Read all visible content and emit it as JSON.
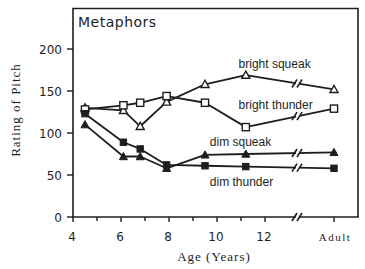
{
  "chart_data": {
    "type": "line",
    "title": "Metaphors",
    "xlabel": "Age (Years)",
    "ylabel": "Rating of Pitch",
    "ylim": [
      0,
      200
    ],
    "yticks": [
      0,
      50,
      100,
      150,
      200
    ],
    "xticks_major": [
      4,
      6,
      8,
      10,
      12
    ],
    "xticks_minor": [
      5,
      7,
      9,
      11
    ],
    "xtick_labels": [
      "4",
      "6",
      "8",
      "10",
      "12",
      "Adult"
    ],
    "x_axis_break": "between 12 and Adult",
    "grid": false,
    "legend": "inline labels",
    "x": [
      4.5,
      6.1,
      6.8,
      7.9,
      9.5,
      11.2,
      "Adult"
    ],
    "series": [
      {
        "name": "bright squeak",
        "marker": "open-triangle",
        "values": [
          130,
          127,
          108,
          137,
          158,
          169,
          152
        ]
      },
      {
        "name": "bright thunder",
        "marker": "open-square",
        "values": [
          128,
          133,
          136,
          144,
          136,
          107,
          129
        ]
      },
      {
        "name": "dim squeak",
        "marker": "filled-triangle",
        "values": [
          110,
          72,
          72,
          58,
          74,
          75,
          77
        ]
      },
      {
        "name": "dim thunder",
        "marker": "filled-square",
        "values": [
          123,
          89,
          81,
          62,
          61,
          60,
          58
        ]
      }
    ],
    "annotations": [
      {
        "text": "bright squeak",
        "x": 10.9,
        "y": 177
      },
      {
        "text": "bright thunder",
        "x": 10.9,
        "y": 128
      },
      {
        "text": "dim squeak",
        "x": 9.7,
        "y": 84
      },
      {
        "text": "dim thunder",
        "x": 9.7,
        "y": 37
      }
    ]
  }
}
